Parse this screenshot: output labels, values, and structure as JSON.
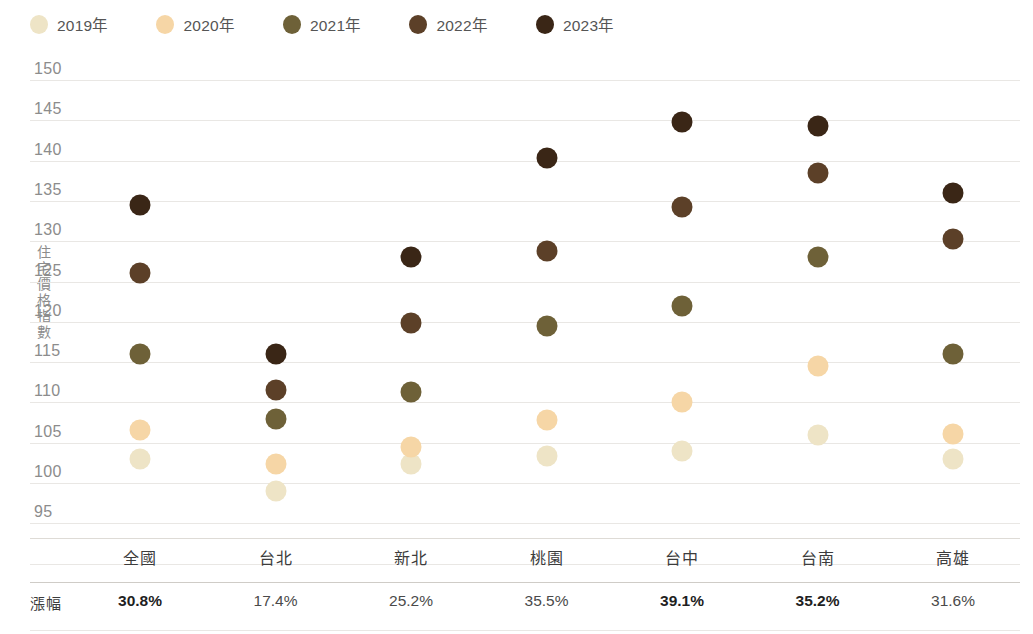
{
  "legend": {
    "items": [
      {
        "label": "2019年",
        "color": "#EEE4C6",
        "icon": "legend-dot-2019"
      },
      {
        "label": "2020年",
        "color": "#F6D6A6",
        "icon": "legend-dot-2020"
      },
      {
        "label": "2021年",
        "color": "#6E6138",
        "icon": "legend-dot-2021"
      },
      {
        "label": "2022年",
        "color": "#5C4028",
        "icon": "legend-dot-2022"
      },
      {
        "label": "2023年",
        "color": "#3A2616",
        "icon": "legend-dot-2023"
      }
    ]
  },
  "axis": {
    "y_title": "住宅價格指數",
    "y_ticks": [
      "150",
      "145",
      "140",
      "135",
      "130",
      "125",
      "120",
      "115",
      "110",
      "105",
      "100",
      "95"
    ]
  },
  "table": {
    "rate_row_header": "漲幅",
    "rates": [
      {
        "value": "30.8%",
        "bold": true
      },
      {
        "value": "17.4%",
        "bold": false
      },
      {
        "value": "25.2%",
        "bold": false
      },
      {
        "value": "35.5%",
        "bold": false
      },
      {
        "value": "39.1%",
        "bold": true
      },
      {
        "value": "35.2%",
        "bold": true
      },
      {
        "value": "31.6%",
        "bold": false
      }
    ]
  },
  "chart_data": {
    "type": "scatter",
    "title": "",
    "xlabel": "",
    "ylabel": "住宅價格指數",
    "ylim": [
      95,
      150
    ],
    "ystep": 5,
    "grid": true,
    "legend_position": "top-left",
    "categories": [
      "全國",
      "台北",
      "新北",
      "桃園",
      "台中",
      "台南",
      "高雄"
    ],
    "series": [
      {
        "name": "2019年",
        "color": "#EEE4C6",
        "values": [
          103.0,
          99.0,
          102.3,
          103.3,
          104.0,
          106.0,
          103.0
        ]
      },
      {
        "name": "2020年",
        "color": "#F6D6A6",
        "values": [
          106.6,
          102.3,
          104.5,
          107.8,
          110.1,
          114.5,
          106.1
        ]
      },
      {
        "name": "2021年",
        "color": "#6E6138",
        "values": [
          116.0,
          108.0,
          111.3,
          119.5,
          122.0,
          128.0,
          116.0
        ]
      },
      {
        "name": "2022年",
        "color": "#5C4028",
        "values": [
          126.0,
          111.6,
          119.8,
          128.8,
          134.3,
          138.5,
          130.3
        ]
      },
      {
        "name": "2023年",
        "color": "#3A2616",
        "values": [
          134.5,
          116.0,
          128.0,
          140.3,
          144.8,
          144.3,
          136.0
        ]
      }
    ]
  }
}
